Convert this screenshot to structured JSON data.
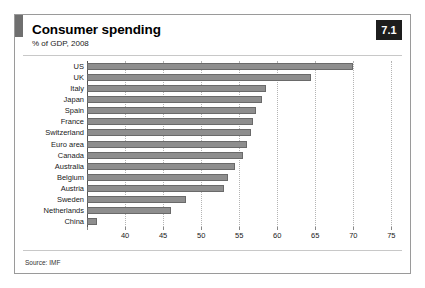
{
  "header": {
    "title": "Consumer spending",
    "subtitle": "% of GDP, 2008",
    "badge": "7.1"
  },
  "footer": {
    "source": "Source: IMF"
  },
  "style": {
    "bar_fill": "#8e8e8e",
    "bar_stroke": "#6a6a6a",
    "badge_bg": "#1d1d1d",
    "grid_color": "#b4b4b4",
    "frame_color": "#9a9a9a"
  },
  "chart_data": {
    "type": "bar",
    "orientation": "horizontal",
    "title": "Consumer spending",
    "subtitle": "% of GDP, 2008",
    "xlabel": "",
    "ylabel": "",
    "xlim": [
      35,
      76
    ],
    "xticks": [
      40,
      45,
      50,
      55,
      60,
      65,
      70,
      75
    ],
    "xtick_labels": [
      "40",
      "45",
      "50",
      "55",
      "60",
      "65",
      "70",
      "75"
    ],
    "grid": true,
    "legend": false,
    "source": "Source: IMF",
    "categories": [
      "US",
      "UK",
      "Italy",
      "Japan",
      "Spain",
      "France",
      "Switzerland",
      "Euro area",
      "Canada",
      "Australia",
      "Belgium",
      "Austria",
      "Sweden",
      "Netherlands",
      "China"
    ],
    "values": [
      70.0,
      64.5,
      58.5,
      58.0,
      57.2,
      56.8,
      56.5,
      56.0,
      55.5,
      54.5,
      53.5,
      53.0,
      48.0,
      46.0,
      36.3
    ]
  }
}
